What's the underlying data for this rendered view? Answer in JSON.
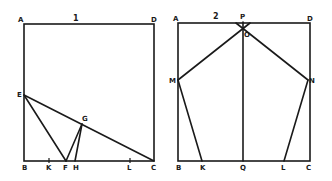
{
  "figures": [
    {
      "number": "1",
      "points": {
        "A": "A",
        "D": "D",
        "B": "B",
        "C": "C",
        "E": "E",
        "G": "G",
        "F": "F",
        "H": "H",
        "K": "K",
        "L": "L"
      }
    },
    {
      "number": "2",
      "points": {
        "A": "A",
        "D": "D",
        "B": "B",
        "C": "C",
        "P": "P",
        "O": "O",
        "M": "M",
        "N": "N",
        "K": "K",
        "Q": "Q",
        "L": "L"
      }
    }
  ],
  "colors": {
    "ink": "#1a1a1a",
    "paper": "#ffffff"
  }
}
